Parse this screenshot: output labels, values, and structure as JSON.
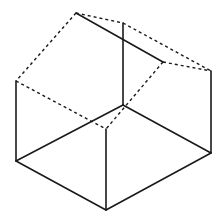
{
  "diagram": {
    "title": "",
    "stroke_color": "#1a1a1a",
    "background": "#ffffff",
    "vertices": {
      "A": [
        76,
        13
      ],
      "B": [
        123,
        23
      ],
      "C": [
        163,
        62
      ],
      "D": [
        211,
        71
      ],
      "E": [
        16,
        81
      ],
      "F": [
        123,
        105
      ],
      "G": [
        106,
        129
      ],
      "H": [
        16,
        161
      ],
      "I": [
        106,
        210
      ],
      "J": [
        211,
        153
      ]
    },
    "edges": [
      {
        "from": "A",
        "to": "C",
        "style": "solid"
      },
      {
        "from": "B",
        "to": "F",
        "style": "solid"
      },
      {
        "from": "A",
        "to": "B",
        "style": "dashed"
      },
      {
        "from": "B",
        "to": "D",
        "style": "dashed"
      },
      {
        "from": "C",
        "to": "D",
        "style": "dashed"
      },
      {
        "from": "A",
        "to": "E",
        "style": "dashed"
      },
      {
        "from": "C",
        "to": "G",
        "style": "dashed"
      },
      {
        "from": "E",
        "to": "G",
        "style": "dashed"
      },
      {
        "from": "E",
        "to": "H",
        "style": "solid"
      },
      {
        "from": "D",
        "to": "J",
        "style": "solid"
      },
      {
        "from": "G",
        "to": "I",
        "style": "solid"
      },
      {
        "from": "H",
        "to": "F",
        "style": "solid"
      },
      {
        "from": "F",
        "to": "J",
        "style": "solid"
      },
      {
        "from": "H",
        "to": "I",
        "style": "solid"
      },
      {
        "from": "I",
        "to": "J",
        "style": "solid"
      }
    ]
  }
}
